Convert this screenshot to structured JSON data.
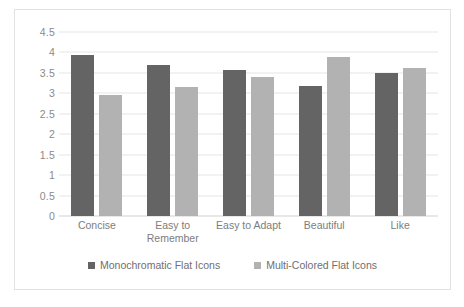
{
  "chart_data": {
    "type": "bar",
    "title": "",
    "subtitle": "",
    "xlabel": "",
    "ylabel": "",
    "categories": [
      "Concise",
      "Easy to Remember",
      "Easy to Adapt",
      "Beautiful",
      "Like"
    ],
    "series": [
      {
        "name": "Monochromatic Flat Icons",
        "color": "#646464",
        "values": [
          3.95,
          3.7,
          3.57,
          3.17,
          3.5
        ]
      },
      {
        "name": "Multi-Colored Flat Icons",
        "color": "#b2b2b2",
        "values": [
          2.97,
          3.15,
          3.4,
          3.9,
          3.62
        ]
      }
    ],
    "ylim": [
      0,
      4.5
    ],
    "ytick_step": 0.5,
    "yticks": [
      "4.5",
      "4",
      "3.5",
      "3",
      "2.5",
      "2",
      "1.5",
      "1",
      "0.5",
      "0"
    ],
    "grid": true,
    "legend_position": "bottom"
  }
}
